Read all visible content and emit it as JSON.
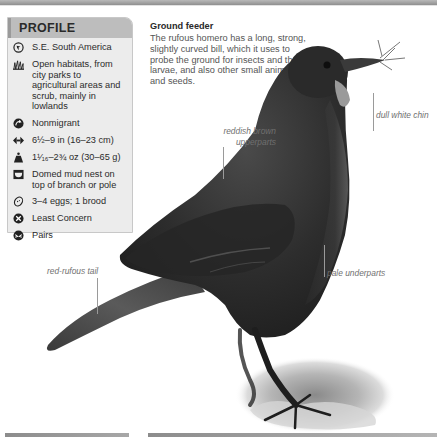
{
  "profile": {
    "title": "PROFILE",
    "items": [
      {
        "icon": "globe-range-icon",
        "text": "S.E. South America"
      },
      {
        "icon": "habitat-grass-icon",
        "text": "Open habitats, from city parks to agricultural areas and scrub, mainly in lowlands"
      },
      {
        "icon": "migration-arrow-icon",
        "text": "Nonmigrant"
      },
      {
        "icon": "length-arrows-icon",
        "text": "6½–9 in (16–23 cm)"
      },
      {
        "icon": "weight-icon",
        "text": "1¹⁄₁₆–2¾ oz (30–65 g)"
      },
      {
        "icon": "nest-icon",
        "text": "Domed mud nest on top of branch or pole"
      },
      {
        "icon": "egg-icon",
        "text": "3–4 eggs; 1 brood"
      },
      {
        "icon": "conservation-status-icon",
        "text": "Least Concern"
      },
      {
        "icon": "social-pairs-icon",
        "text": "Pairs"
      }
    ]
  },
  "feeder": {
    "title": "Ground feeder",
    "text": "The rufous homero has a long, strong, slightly curved bill, which it uses to probe the ground for insects and their larvae, and also other small animals and seeds."
  },
  "annotations": {
    "chin": "dull white chin",
    "upperparts_line1": "reddish brown",
    "upperparts_line2": "upperparts",
    "tail": "red-rufous tail",
    "underparts": "pale underparts"
  },
  "colors": {
    "profile_header": "#bdbdbd",
    "profile_bg": "#ececec",
    "bird_dark": "#2e2e2e",
    "label_text": "#707070"
  }
}
